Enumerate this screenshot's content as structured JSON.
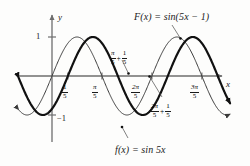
{
  "figure": {
    "background_color": "#fdfdfc",
    "ink_color": "#1a1a1a",
    "axis_color": "#6e6e6e"
  },
  "axes": {
    "x_label": "x",
    "y_label": "y",
    "y_ticks": [
      {
        "label": "1",
        "value": 1
      },
      {
        "label": "−1",
        "value": -1
      }
    ],
    "x_ticks": [
      {
        "label_num": "1",
        "label_den": "5",
        "value": 0.2
      },
      {
        "label_num": "π",
        "label_den": "5",
        "value": 0.6283
      },
      {
        "label_num": "2π",
        "label_den": "5",
        "value": 1.2566
      },
      {
        "label_num": "3π",
        "label_den": "5",
        "value": 1.885
      }
    ]
  },
  "annotations": {
    "curve_thin_label": "f(x) = sin 5x",
    "curve_thick_label": "F(x) = sin(5x − 1)",
    "shift_mid": {
      "a_num": "π",
      "a_den": "5",
      "plus": "+",
      "b_num": "1",
      "b_den": "5"
    },
    "shift_right": {
      "a_num": "2π",
      "a_den": "5",
      "plus": "+",
      "b_num": "1",
      "b_den": "5"
    }
  },
  "chart_data": {
    "type": "line",
    "title": "",
    "xlabel": "x",
    "ylabel": "y",
    "grid": false,
    "legend": "inline-annotations",
    "xlim": [
      -0.42,
      2.24
    ],
    "ylim": [
      -1.38,
      1.38
    ],
    "series": [
      {
        "name": "f(x) = sin 5x",
        "expression": "sin(5x)",
        "amplitude": 1,
        "frequency": 5,
        "phase_shift": 0,
        "period": 1.2566,
        "stroke_width": 1,
        "color": "#3a3a3a",
        "zero_crossings": [
          0,
          0.6283,
          1.2566,
          1.885
        ],
        "maxima_x": [
          0.3142,
          1.5708
        ],
        "minima_x": [
          -0.3142,
          0.9425,
          2.199
        ],
        "arrow_left": true,
        "arrow_right": true
      },
      {
        "name": "F(x) = sin(5x - 1)",
        "expression": "sin(5x - 1)",
        "amplitude": 1,
        "frequency": 5,
        "phase_shift": 0.2,
        "period": 1.2566,
        "stroke_width": 2.2,
        "color": "#111111",
        "zero_crossings": [
          0.2,
          0.8283,
          1.4566,
          2.085
        ],
        "maxima_x": [
          0.5142,
          1.7708
        ],
        "minima_x": [
          -0.1142,
          1.1425
        ],
        "arrow_left": true,
        "arrow_right": true
      }
    ],
    "sample_points": {
      "x_start": -0.42,
      "x_end": 2.24,
      "n": 420
    }
  }
}
